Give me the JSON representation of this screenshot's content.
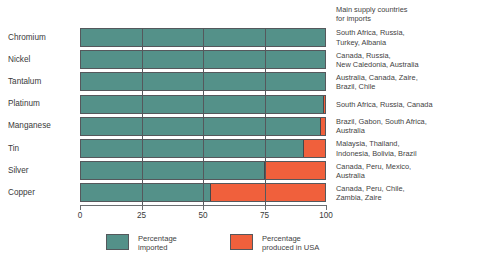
{
  "chart_data": {
    "type": "bar",
    "orientation": "horizontal",
    "stacked": true,
    "title": "",
    "xlabel": "",
    "ylabel": "",
    "xlim": [
      0,
      100
    ],
    "ticks": [
      "0",
      "25",
      "50",
      "75",
      "100"
    ],
    "tick_values": [
      0,
      25,
      50,
      75,
      100
    ],
    "grid": true,
    "grid_axis": "x",
    "legend_position": "bottom-left",
    "categories": [
      "Chromium",
      "Nickel",
      "Tantalum",
      "Platinum",
      "Manganese",
      "Tin",
      "Silver",
      "Copper"
    ],
    "series": [
      {
        "name": "Percentage imported",
        "color": "#549189",
        "values": [
          100,
          100,
          100,
          99,
          98,
          91,
          75,
          53
        ]
      },
      {
        "name": "Percentage produced in USA",
        "color": "#f0603c",
        "values": [
          0,
          0,
          0,
          1,
          2,
          9,
          25,
          47
        ]
      }
    ],
    "annotations": {
      "supply_header": "Main supply countries\nfor imports",
      "supply_countries": [
        "South Africa, Russia,\nTurkey, Albania",
        "Canada, Russia,\nNew Caledonia, Australia",
        "Australia, Canada, Zaire,\nBrazil, Chile",
        "South Africa, Russia, Canada",
        "Brazil, Gabon, South Africa,\nAustralia",
        "Malaysia, Thailand,\nIndonesia, Bolivia, Brazil",
        "Canada, Peru, Mexico,\nAustralia",
        "Canada, Peru, Chile,\nZambia, Zaire"
      ]
    }
  },
  "legend": {
    "items": [
      {
        "label": "Percentage\nimported",
        "color": "#549189"
      },
      {
        "label": "Percentage\nproduced in USA",
        "color": "#f0603c"
      }
    ]
  },
  "colors": {
    "imported": "#549189",
    "produced_usa": "#f0603c",
    "outline": "#55585c",
    "text": "#3a3a3a",
    "background": "#ffffff"
  }
}
